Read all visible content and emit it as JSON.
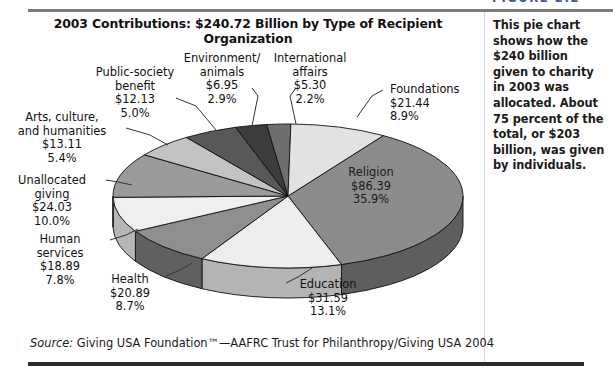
{
  "figure_label": "FIGURE 2.2",
  "title": "2003 Contributions: $240.72 Billion by Type of Recipient Organization",
  "sidebar_note": "This pie chart shows how the $240 billion given to charity in 2003 was allocated. About 75 percent of the total, or $203 billion, was given by individuals.",
  "source": {
    "prefix": "Source:",
    "text": " Giving USA Foundation™—AAFRC Trust for Philanthropy/Giving USA 2004"
  },
  "chart_data": {
    "type": "pie",
    "title": "2003 Contributions: $240.72 Billion by Type of Recipient Organization",
    "total": 240.72,
    "units": "billions of US dollars",
    "legend": "none",
    "labels_inline": true,
    "categories": [
      "Religion",
      "Education",
      "Health",
      "Human services",
      "Unallocated giving",
      "Arts, culture, and humanities",
      "Public-society benefit",
      "Environment/ animals",
      "International affairs",
      "Foundations"
    ],
    "values": [
      86.39,
      31.59,
      20.89,
      18.89,
      24.03,
      13.11,
      12.13,
      6.95,
      5.3,
      21.44
    ],
    "percents": [
      35.9,
      13.1,
      8.7,
      7.8,
      10.0,
      5.4,
      5.0,
      2.9,
      2.2,
      8.9
    ],
    "slices": [
      {
        "name": "Religion",
        "value": "$86.39",
        "percent": "35.9%",
        "label_lines": [
          "Religion",
          "$86.39",
          "35.9%"
        ],
        "color": "#8c8c8c",
        "side_color": "#5e5e5e",
        "label_placement": "inside"
      },
      {
        "name": "Education",
        "value": "$31.59",
        "percent": "13.1%",
        "label_lines": [
          "Education",
          "$31.59",
          "13.1%"
        ],
        "color": "#ededed",
        "side_color": "#b4b4b4",
        "label_placement": "outside"
      },
      {
        "name": "Health",
        "value": "$20.89",
        "percent": "8.7%",
        "label_lines": [
          "Health",
          "$20.89",
          "8.7%"
        ],
        "color": "#8f8f8f",
        "side_color": "#606060",
        "label_placement": "outside"
      },
      {
        "name": "Human services",
        "value": "$18.89",
        "percent": "7.8%",
        "label_lines": [
          "Human",
          "services",
          "$18.89",
          "7.8%"
        ],
        "color": "#efefef",
        "side_color": "#b6b6b6",
        "label_placement": "outside"
      },
      {
        "name": "Unallocated giving",
        "value": "$24.03",
        "percent": "10.0%",
        "label_lines": [
          "Unallocated",
          "giving",
          "$24.03",
          "10.0%"
        ],
        "color": "#9a9a9a",
        "side_color": "#343434",
        "label_placement": "outside"
      },
      {
        "name": "Arts, culture, and humanities",
        "value": "$13.11",
        "percent": "5.4%",
        "label_lines": [
          "Arts, culture,",
          "and humanities",
          "$13.11",
          "5.4%"
        ],
        "color": "#c3c3c3",
        "side_color": "#8a8a8a",
        "label_placement": "outside"
      },
      {
        "name": "Public-society benefit",
        "value": "$12.13",
        "percent": "5.0%",
        "label_lines": [
          "Public-society",
          "benefit",
          "$12.13",
          "5.0%"
        ],
        "color": "#585858",
        "side_color": "#3a3a3a",
        "label_placement": "outside"
      },
      {
        "name": "Environment/ animals",
        "value": "$6.95",
        "percent": "2.9%",
        "label_lines": [
          "Environment/",
          "animals",
          "$6.95",
          "2.9%"
        ],
        "color": "#3c3c3c",
        "side_color": "#2a2a2a",
        "label_placement": "outside"
      },
      {
        "name": "International affairs",
        "value": "$5.30",
        "percent": "2.2%",
        "label_lines": [
          "International",
          "affairs",
          "$5.30",
          "2.2%"
        ],
        "color": "#6e6e6e",
        "side_color": "#4a4a4a",
        "label_placement": "outside"
      },
      {
        "name": "Foundations",
        "value": "$21.44",
        "percent": "8.9%",
        "label_lines": [
          "Foundations",
          "$21.44",
          "8.9%"
        ],
        "color": "#e2e2e2",
        "side_color": "#a8a8a8",
        "label_placement": "outside"
      }
    ]
  }
}
